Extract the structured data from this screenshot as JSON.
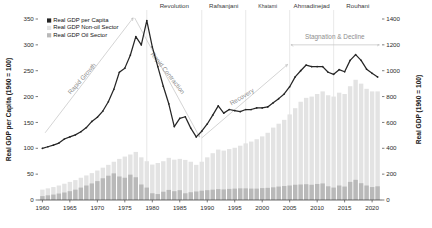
{
  "chart_data": {
    "type": "line",
    "title": "",
    "xlabel": "",
    "ylabel": "Real GDP per Capita (1960 = 100)",
    "ylabel_right": "Real GDP (1960 = 100)",
    "xlim": [
      1959.2,
      2021.8
    ],
    "ylim_left": [
      0,
      350
    ],
    "ylim_right": [
      0,
      1400
    ],
    "xticks": [
      1960,
      1965,
      1970,
      1975,
      1980,
      1985,
      1990,
      1995,
      2000,
      2005,
      2010,
      2015,
      2020
    ],
    "yticks_left": [
      0,
      50,
      100,
      150,
      200,
      250,
      300,
      350
    ],
    "yticks_right": [
      0,
      200,
      400,
      600,
      800,
      1000,
      1200,
      1400
    ],
    "grid": "vertical-era-dividers",
    "legend_position": "top-left",
    "legend": [
      {
        "label": "Real GDP per Capita",
        "color": "#262626",
        "kind": "line"
      },
      {
        "label": "Real GDP Non-oil Sector",
        "color": "#e3e3e3",
        "kind": "bar"
      },
      {
        "label": "Real GDP Oil Sector",
        "color": "#b9b9b9",
        "kind": "bar"
      }
    ],
    "x": [
      1960,
      1961,
      1962,
      1963,
      1964,
      1965,
      1966,
      1967,
      1968,
      1969,
      1970,
      1971,
      1972,
      1973,
      1974,
      1975,
      1976,
      1977,
      1978,
      1979,
      1980,
      1981,
      1982,
      1983,
      1984,
      1985,
      1986,
      1987,
      1988,
      1989,
      1990,
      1991,
      1992,
      1993,
      1994,
      1995,
      1996,
      1997,
      1998,
      1999,
      2000,
      2001,
      2002,
      2003,
      2004,
      2005,
      2006,
      2007,
      2008,
      2009,
      2010,
      2011,
      2012,
      2013,
      2014,
      2015,
      2016,
      2017,
      2018,
      2019,
      2020,
      2021
    ],
    "series": [
      {
        "name": "Real GDP per Capita",
        "axis": "left",
        "color": "#262626",
        "values": [
          100,
          103,
          106,
          110,
          118,
          122,
          126,
          132,
          140,
          152,
          160,
          172,
          190,
          214,
          247,
          255,
          280,
          316,
          300,
          347,
          296,
          258,
          220,
          186,
          142,
          158,
          161,
          139,
          122,
          133,
          147,
          164,
          182,
          168,
          175,
          173,
          171,
          175,
          175,
          178,
          178,
          180,
          188,
          196,
          205,
          219,
          238,
          250,
          261,
          258,
          258,
          258,
          247,
          243,
          252,
          248,
          270,
          281,
          270,
          253,
          245,
          238
        ]
      },
      {
        "name": "Real GDP Non-oil Sector",
        "axis": "right",
        "color": "#e3e3e3",
        "values": [
          80,
          90,
          100,
          112,
          126,
          140,
          154,
          172,
          190,
          208,
          228,
          250,
          272,
          296,
          318,
          336,
          352,
          372,
          330,
          300,
          274,
          286,
          300,
          326,
          312,
          318,
          310,
          296,
          272,
          296,
          330,
          362,
          390,
          382,
          394,
          404,
          420,
          438,
          452,
          470,
          492,
          520,
          560,
          590,
          620,
          662,
          710,
          760,
          790,
          800,
          820,
          840,
          810,
          800,
          830,
          820,
          880,
          930,
          900,
          860,
          840,
          840
        ]
      },
      {
        "name": "Real GDP Oil Sector",
        "axis": "right",
        "color": "#b9b9b9",
        "values": [
          30,
          36,
          42,
          50,
          58,
          68,
          80,
          96,
          112,
          128,
          146,
          168,
          188,
          206,
          182,
          172,
          196,
          176,
          120,
          96,
          52,
          46,
          64,
          78,
          68,
          76,
          52,
          60,
          66,
          72,
          76,
          80,
          84,
          82,
          86,
          88,
          90,
          90,
          88,
          88,
          92,
          94,
          98,
          104,
          108,
          112,
          118,
          120,
          122,
          118,
          124,
          128,
          106,
          96,
          112,
          104,
          140,
          156,
          130,
          112,
          100,
          106
        ]
      }
    ],
    "eras": [
      {
        "label": "Revolution",
        "x": 1979,
        "small": false
      },
      {
        "label": "Rafsanjani",
        "x": 1989,
        "small": false
      },
      {
        "label": "Khatami",
        "x": 1997,
        "small": true
      },
      {
        "label": "Ahmadinejad",
        "x": 2005,
        "small": false
      },
      {
        "label": "Rouhani",
        "x": 2013,
        "small": false
      }
    ],
    "annotations": [
      {
        "label": "Rapid Growth",
        "x1": 1960.5,
        "y1": 130,
        "x2": 1976.5,
        "y2": 352,
        "rotate": -49,
        "lx": 1967.5,
        "ly": 232
      },
      {
        "label": "Rapid Contraction",
        "x1": 1976.8,
        "y1": 352,
        "x2": 1988.6,
        "y2": 122,
        "rotate": 52,
        "lx": 1982.5,
        "ly": 243
      },
      {
        "label": "Recovery",
        "x1": 1989.0,
        "y1": 120,
        "x2": 2004.6,
        "y2": 262,
        "rotate": -31,
        "lx": 1996.5,
        "ly": 196
      },
      {
        "label": "Stagnation & Decline",
        "x1": 2005.2,
        "y1": 300,
        "x2": 2021.3,
        "y2": 300,
        "rotate": 0,
        "lx": 2013.2,
        "ly": 312
      }
    ]
  }
}
